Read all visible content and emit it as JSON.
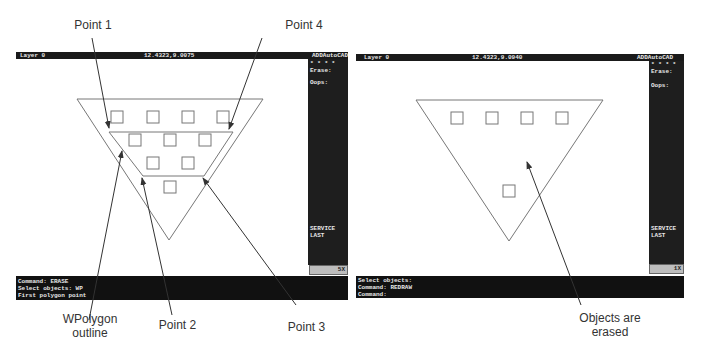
{
  "left_screen": {
    "status": {
      "layer": "Layer 0",
      "coords": "12.4323,9.0075",
      "app": "ADDAutoCAD"
    },
    "side_menu": {
      "stars": "* * * *",
      "items": [
        "Erase:",
        "Oops:",
        "SERVICE",
        "LAST"
      ]
    },
    "zoom_box": "5X",
    "command_lines": [
      "Command: ERASE",
      "Select objects: WP",
      "First polygon point"
    ]
  },
  "right_screen": {
    "status": {
      "layer": "Layer 0",
      "coords": "12.4323,9.0940",
      "app": "ADDAutoCAD"
    },
    "side_menu": {
      "stars": "* * * *",
      "items": [
        "Erase:",
        "Oops:",
        "SERVICE",
        "LAST"
      ]
    },
    "zoom_box": "1X",
    "command_lines": [
      "Select objects:",
      "Command: REDRAW",
      "Command:"
    ]
  },
  "callouts": {
    "point1": "Point 1",
    "point4": "Point 4",
    "wpolygon_line1": "WPolygon",
    "wpolygon_line2": "outline",
    "point2": "Point 2",
    "point3": "Point 3",
    "erased_line1": "Objects are",
    "erased_line2": "erased"
  },
  "colors": {
    "status_bg": "#1a1a1a",
    "menu_bg": "#1e1e1e",
    "zoom_box_bg": "#bdbdbd",
    "drawing_line": "#777777",
    "leader_line": "#333333"
  }
}
